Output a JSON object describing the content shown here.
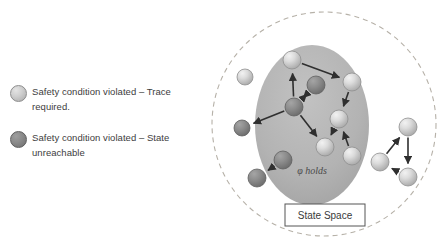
{
  "legend": {
    "items": [
      {
        "id": "trace-required",
        "swatch": "light-grey-circle",
        "color": "#cfcfcf",
        "label": "Safety condition violated – Trace required."
      },
      {
        "id": "state-unreachable",
        "swatch": "dark-grey-circle",
        "color": "#8a8a8a",
        "label": "Safety condition violated – State unreachable"
      }
    ]
  },
  "diagram": {
    "outer_boundary": {
      "shape": "dashed-circle",
      "stroke": "#b6b1a8",
      "cx": 124,
      "cy": 124,
      "r": 112
    },
    "region": {
      "shape": "ellipse",
      "fill": "#b4b4b4",
      "label": "φ holds",
      "cx": 112,
      "cy": 125,
      "rx": 57,
      "ry": 80
    },
    "caption": {
      "label": "State Space",
      "box_stroke": "#555555",
      "box_fill": "#ffffff"
    },
    "node_colors": {
      "light": "#d5d5d5",
      "dark": "#8a8a8a"
    },
    "edge_color": "#2f2f2f",
    "nodes": [
      {
        "id": "n1",
        "x": 45,
        "y": 77,
        "r": 8,
        "type": "light"
      },
      {
        "id": "n2",
        "x": 42,
        "y": 128,
        "r": 8,
        "type": "dark"
      },
      {
        "id": "n3",
        "x": 92,
        "y": 60,
        "r": 9,
        "type": "light"
      },
      {
        "id": "n4",
        "x": 152,
        "y": 82,
        "r": 9,
        "type": "light"
      },
      {
        "id": "n5",
        "x": 116,
        "y": 85,
        "r": 9,
        "type": "dark"
      },
      {
        "id": "n6",
        "x": 94,
        "y": 107,
        "r": 9,
        "type": "dark"
      },
      {
        "id": "n7",
        "x": 139,
        "y": 119,
        "r": 9,
        "type": "light"
      },
      {
        "id": "n8",
        "x": 125,
        "y": 147,
        "r": 9,
        "type": "light"
      },
      {
        "id": "n9",
        "x": 152,
        "y": 156,
        "r": 9,
        "type": "light"
      },
      {
        "id": "n10",
        "x": 83,
        "y": 160,
        "r": 9,
        "type": "dark"
      },
      {
        "id": "n11",
        "x": 57,
        "y": 178,
        "r": 9,
        "type": "dark"
      },
      {
        "id": "n12",
        "x": 208,
        "y": 127,
        "r": 9,
        "type": "light"
      },
      {
        "id": "n13",
        "x": 180,
        "y": 162,
        "r": 9,
        "type": "light"
      },
      {
        "id": "n14",
        "x": 208,
        "y": 177,
        "r": 9,
        "type": "light"
      }
    ],
    "edges": [
      {
        "from": "n3",
        "to": "n4"
      },
      {
        "from": "n6",
        "to": "n3"
      },
      {
        "from": "n5",
        "to": "n6"
      },
      {
        "from": "n6",
        "to": "n5"
      },
      {
        "from": "n6",
        "to": "n2"
      },
      {
        "from": "n4",
        "to": "n7"
      },
      {
        "from": "n6",
        "to": "n8"
      },
      {
        "from": "n9",
        "to": "n7"
      },
      {
        "from": "n7",
        "to": "n8"
      },
      {
        "from": "n10",
        "to": "n11"
      },
      {
        "from": "n13",
        "to": "n12"
      },
      {
        "from": "n12",
        "to": "n14"
      },
      {
        "from": "n14",
        "to": "n13"
      }
    ]
  }
}
